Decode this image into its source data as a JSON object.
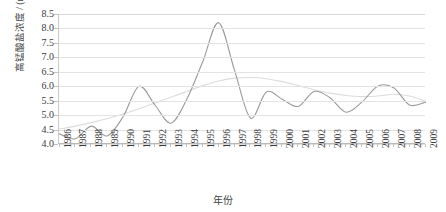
{
  "chart_data": {
    "type": "line",
    "title": "",
    "xlabel": "年份",
    "ylabel": "高锰酸盐浓度 / (mg/L)",
    "ylim": [
      4.0,
      8.5
    ],
    "ytick_step": 0.5,
    "grid": true,
    "legend": "none",
    "yticks": [
      "8.5",
      "8.0",
      "7.5",
      "7.0",
      "6.5",
      "6.0",
      "5.5",
      "5.0",
      "4.5",
      "4.0"
    ],
    "ytick_values": [
      8.5,
      8.0,
      7.5,
      7.0,
      6.5,
      6.0,
      5.5,
      5.0,
      4.5,
      4.0
    ],
    "categories": [
      "1986",
      "1987",
      "1988",
      "1989",
      "1990",
      "1991",
      "1992",
      "1993",
      "1994",
      "1995",
      "1996",
      "1997",
      "1998",
      "1999",
      "2000",
      "2001",
      "2002",
      "2003",
      "2004",
      "2005",
      "2006",
      "2007",
      "2008",
      "2009"
    ],
    "x": [
      1986,
      1987,
      1988,
      1989,
      1990,
      1991,
      1992,
      1993,
      1994,
      1995,
      1996,
      1997,
      1998,
      1999,
      2000,
      2001,
      2002,
      2003,
      2004,
      2005,
      2006,
      2007,
      2008,
      2009
    ],
    "series": [
      {
        "name": "高锰酸盐浓度",
        "color": "#9a9a9a",
        "values": [
          4.35,
          4.18,
          4.62,
          4.28,
          4.95,
          6.0,
          5.35,
          4.72,
          5.55,
          6.85,
          8.2,
          6.55,
          4.9,
          5.8,
          5.55,
          5.3,
          5.82,
          5.6,
          5.1,
          5.45,
          6.0,
          5.95,
          5.35,
          5.45
        ]
      },
      {
        "name": "趋势线",
        "color": "#dcdcdc",
        "values": [
          4.52,
          4.62,
          4.74,
          4.88,
          5.04,
          5.22,
          5.42,
          5.62,
          5.82,
          6.02,
          6.18,
          6.28,
          6.3,
          6.26,
          6.16,
          6.02,
          5.88,
          5.76,
          5.68,
          5.64,
          5.66,
          5.72,
          5.66,
          5.48
        ]
      }
    ]
  }
}
